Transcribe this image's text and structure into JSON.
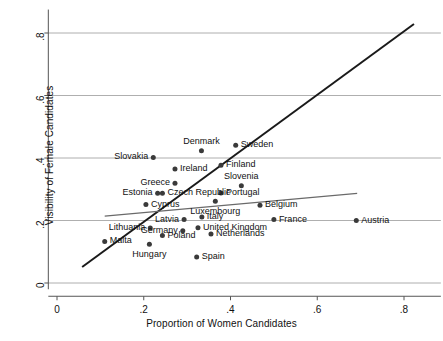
{
  "chart_data": {
    "type": "scatter",
    "title": "",
    "xlabel": "Proportion of Women Candidates",
    "ylabel": "Visibility of Female Candidates",
    "xlim": [
      -0.02,
      0.885
    ],
    "ylim": [
      -0.02,
      0.875
    ],
    "xticks": [
      "0",
      ".2",
      ".4",
      ".6",
      ".8"
    ],
    "xtick_values": [
      0,
      0.2,
      0.4,
      0.6,
      0.8
    ],
    "yticks": [
      "0",
      ".2",
      ".4",
      ".6",
      ".8"
    ],
    "ytick_values": [
      0,
      0.2,
      0.4,
      0.6,
      0.8
    ],
    "grid": "horizontal",
    "legend": "none",
    "marker_color": "#3a3a3a",
    "gridline_color": "#9a9a9a",
    "axis_color": "#555555",
    "points": [
      {
        "label": "Slovakia",
        "x": 0.222,
        "y": 0.402,
        "label_side": "left"
      },
      {
        "label": "Denmark",
        "x": 0.333,
        "y": 0.423,
        "label_side": "above"
      },
      {
        "label": "Sweden",
        "x": 0.412,
        "y": 0.441,
        "label_side": "right"
      },
      {
        "label": "Finland",
        "x": 0.378,
        "y": 0.377,
        "label_side": "right"
      },
      {
        "label": "Ireland",
        "x": 0.272,
        "y": 0.365,
        "label_side": "right"
      },
      {
        "label": "Greece",
        "x": 0.272,
        "y": 0.319,
        "label_side": "left"
      },
      {
        "label": "Slovenia",
        "x": 0.425,
        "y": 0.311,
        "label_side": "above"
      },
      {
        "label": "Estonia",
        "x": 0.232,
        "y": 0.287,
        "label_side": "left"
      },
      {
        "label": "Czech Republic",
        "x": 0.243,
        "y": 0.287,
        "label_side": "right"
      },
      {
        "label": "Portugal",
        "x": 0.378,
        "y": 0.288,
        "label_side": "right"
      },
      {
        "label": "Cyprus",
        "x": 0.205,
        "y": 0.251,
        "label_side": "right"
      },
      {
        "label": "Luxembourg",
        "x": 0.365,
        "y": 0.262,
        "label_side": "below"
      },
      {
        "label": "Belgium",
        "x": 0.468,
        "y": 0.249,
        "label_side": "right"
      },
      {
        "label": "Latvia",
        "x": 0.293,
        "y": 0.203,
        "label_side": "left"
      },
      {
        "label": "Italy",
        "x": 0.334,
        "y": 0.211,
        "label_side": "right"
      },
      {
        "label": "France",
        "x": 0.5,
        "y": 0.203,
        "label_side": "right"
      },
      {
        "label": "Austria",
        "x": 0.69,
        "y": 0.2,
        "label_side": "right"
      },
      {
        "label": "Lithuania",
        "x": 0.215,
        "y": 0.176,
        "label_side": "left"
      },
      {
        "label": "Germany",
        "x": 0.29,
        "y": 0.167,
        "label_side": "left"
      },
      {
        "label": "United Kingdom",
        "x": 0.325,
        "y": 0.177,
        "label_side": "right"
      },
      {
        "label": "Netherlands",
        "x": 0.355,
        "y": 0.157,
        "label_side": "right"
      },
      {
        "label": "Malta",
        "x": 0.11,
        "y": 0.133,
        "label_side": "right"
      },
      {
        "label": "Poland",
        "x": 0.243,
        "y": 0.152,
        "label_side": "right"
      },
      {
        "label": "Hungary",
        "x": 0.213,
        "y": 0.124,
        "label_side": "below"
      },
      {
        "label": "Spain",
        "x": 0.322,
        "y": 0.083,
        "label_side": "right"
      }
    ],
    "lines": [
      {
        "name": "steep-fit-line",
        "color": "#1a1a1a",
        "width": 2.0,
        "x0": 0.058,
        "y0": 0.051,
        "x1": 0.823,
        "y1": 0.829
      },
      {
        "name": "flat-fit-line",
        "color": "#6a6a6a",
        "width": 1.2,
        "x0": 0.11,
        "y0": 0.214,
        "x1": 0.692,
        "y1": 0.287
      }
    ]
  }
}
